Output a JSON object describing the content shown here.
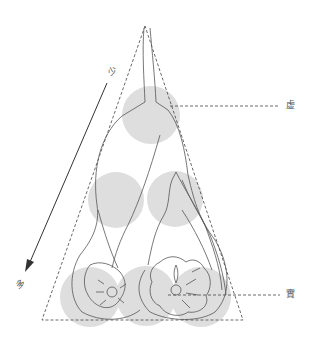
{
  "diagram": {
    "type": "triangular-composition-diagram",
    "labels": {
      "void": "虚",
      "solid": "實",
      "few": "少",
      "many": "多"
    },
    "colors": {
      "circle_fill": "#dedede",
      "line": "#555555",
      "dashed": "#444444",
      "arrow": "#333333",
      "background": "#ffffff"
    },
    "circles": [
      {
        "cx": 151,
        "cy": 115,
        "r": 29
      },
      {
        "cx": 116,
        "cy": 200,
        "r": 28
      },
      {
        "cx": 175,
        "cy": 200,
        "r": 28
      },
      {
        "cx": 90,
        "cy": 296,
        "r": 30
      },
      {
        "cx": 145,
        "cy": 296,
        "r": 30
      },
      {
        "cx": 200,
        "cy": 296,
        "r": 30
      }
    ]
  }
}
